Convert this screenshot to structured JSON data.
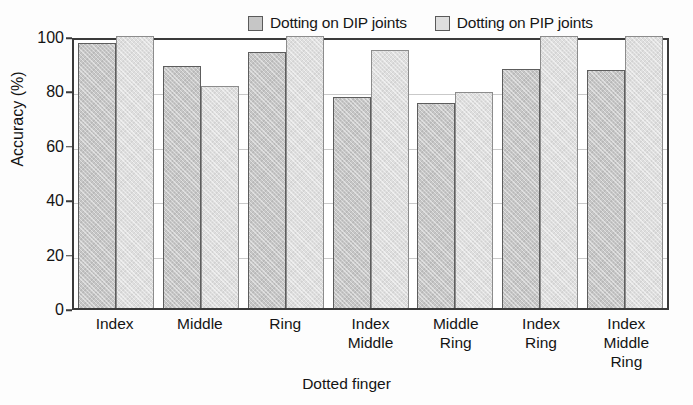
{
  "chart_data": {
    "type": "bar",
    "title": "",
    "xlabel": "Dotted finger",
    "ylabel": "Accuracy (%)",
    "ylim": [
      0,
      100
    ],
    "yticks": [
      0,
      20,
      40,
      60,
      80,
      100
    ],
    "ytick_labels": [
      "0",
      "20",
      "40",
      "60",
      "80",
      "100"
    ],
    "grid": true,
    "legend_position": "top",
    "categories": [
      [
        "Index"
      ],
      [
        "Middle"
      ],
      [
        "Ring"
      ],
      [
        "Index",
        "Middle"
      ],
      [
        "Middle",
        "Ring"
      ],
      [
        "Index",
        "Ring"
      ],
      [
        "Index",
        "Middle",
        "Ring"
      ]
    ],
    "category_labels": [
      "Index",
      "Middle",
      "Ring",
      "Index Middle",
      "Middle Ring",
      "Index Ring",
      "Index Middle Ring"
    ],
    "series": [
      {
        "name": "Dotting on DIP joints",
        "color": "#c6c6c6",
        "values": [
          97.5,
          89.0,
          94.0,
          77.5,
          75.5,
          88.0,
          87.5
        ]
      },
      {
        "name": "Dotting on PIP joints",
        "color": "#dedede",
        "values": [
          100.0,
          81.5,
          100.0,
          95.0,
          79.5,
          100.0,
          100.0
        ]
      }
    ]
  },
  "legend": {
    "entries": [
      {
        "label": "Dotting on DIP joints",
        "swatch": "dip"
      },
      {
        "label": "Dotting on PIP joints",
        "swatch": "pip"
      }
    ]
  },
  "axes": {
    "y_title": "Accuracy (%)",
    "x_title": "Dotted finger"
  }
}
